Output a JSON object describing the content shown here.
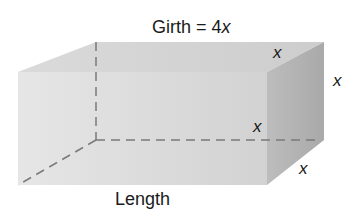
{
  "diagram": {
    "title_prefix": "Girth = 4",
    "title_var": "x",
    "length_label": "Length",
    "edge_labels": {
      "top_depth": "x",
      "right_height": "x",
      "hidden_width": "x",
      "bottom_depth": "x"
    },
    "colors": {
      "front_face": "#e2e2e2",
      "top_face": "#d6d6d6",
      "right_face": "#b4b4b4",
      "hidden_edges": "#7a7a7a"
    }
  }
}
